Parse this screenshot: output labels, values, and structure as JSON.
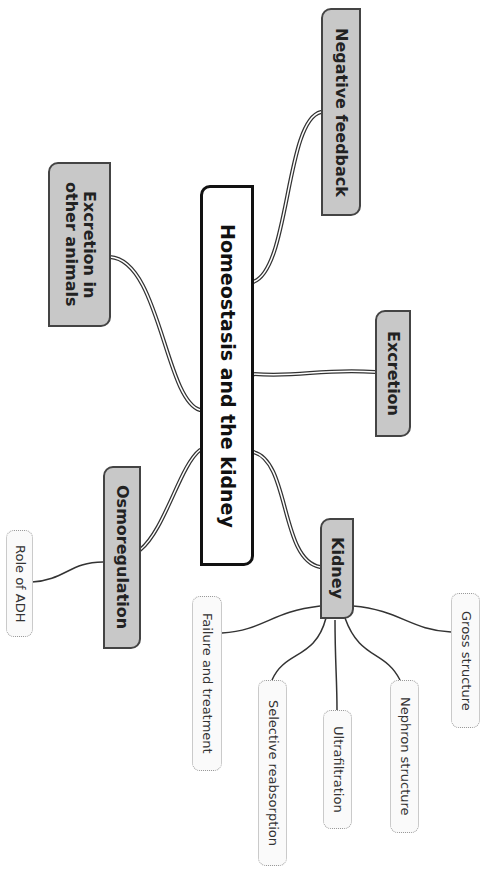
{
  "diagram": {
    "type": "mind-map",
    "orientation": "rotated-90-clockwise",
    "central": {
      "label": "Homeostasis and the kidney"
    },
    "branches": [
      {
        "id": "negative-feedback",
        "label": "Negative feedback",
        "children": []
      },
      {
        "id": "excretion-other-animals",
        "label": "Excretion in other animals",
        "children": []
      },
      {
        "id": "excretion",
        "label": "Excretion",
        "children": []
      },
      {
        "id": "osmoregulation",
        "label": "Osmoregulation",
        "children": [
          {
            "label": "Role of ADH"
          }
        ]
      },
      {
        "id": "kidney",
        "label": "Kidney",
        "children": [
          {
            "label": "Failure and treatment"
          },
          {
            "label": "Selective reabsorption"
          },
          {
            "label": "Ultrafiltration"
          },
          {
            "label": "Nephron structure"
          },
          {
            "label": "Gross structure"
          }
        ]
      }
    ]
  },
  "colors": {
    "central_fill": "#ffffff",
    "central_border": "#111111",
    "branch_fill": "#c8c8c8",
    "branch_border": "#444444",
    "leaf_fill": "#fafafa",
    "leaf_border": "#999999",
    "connector": "#333333"
  }
}
